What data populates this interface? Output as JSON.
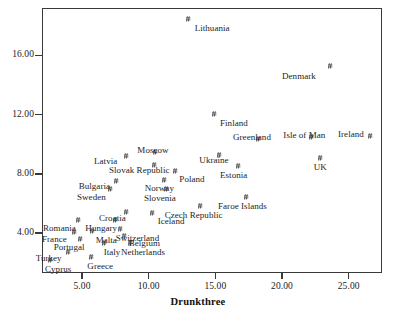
{
  "chart_data": {
    "type": "scatter",
    "title": "",
    "xlabel": "Drunkthree",
    "ylabel": "",
    "xlim": [
      2.0,
      27.5
    ],
    "ylim": [
      1.3,
      19.2
    ],
    "grid": false,
    "legend": "none",
    "marker": "hash-marker",
    "xticks": [
      "5.00",
      "10.00",
      "15.00",
      "20.00",
      "25.00"
    ],
    "xtick_values": [
      5,
      10,
      15,
      20,
      25
    ],
    "yticks": [
      "4.00",
      "8.00",
      "12.00",
      "16.00"
    ],
    "ytick_values": [
      4,
      8,
      12,
      16
    ],
    "points": [
      {
        "label": "Lithuania",
        "x": 13.0,
        "y": 18.45,
        "lx": 6,
        "ly": 4
      },
      {
        "label": "Denmark",
        "x": 23.6,
        "y": 15.25,
        "lx": -48,
        "ly": 5
      },
      {
        "label": "Finland",
        "x": 14.9,
        "y": 12.05,
        "lx": 6,
        "ly": 4
      },
      {
        "label": "Ireland",
        "x": 26.6,
        "y": 10.55,
        "lx": -32,
        "ly": -7
      },
      {
        "label": "Isle of Man",
        "x": 22.2,
        "y": 10.5,
        "lx": -28,
        "ly": -7
      },
      {
        "label": "Greenland",
        "x": 18.2,
        "y": 10.35,
        "lx": -25,
        "ly": -7
      },
      {
        "label": "UK",
        "x": 22.9,
        "y": 9.1,
        "lx": -7,
        "ly": 4
      },
      {
        "label": "Ukraine",
        "x": 15.3,
        "y": 9.25,
        "lx": -20,
        "ly": 0
      },
      {
        "label": "Estonia",
        "x": 16.7,
        "y": 8.5,
        "lx": -18,
        "ly": 4
      },
      {
        "label": "Moscow",
        "x": 10.5,
        "y": 9.5,
        "lx": -18,
        "ly": -7
      },
      {
        "label": "Latvia",
        "x": 8.3,
        "y": 9.2,
        "lx": -32,
        "ly": 0
      },
      {
        "label": "Slovak Republic",
        "x": 10.4,
        "y": 8.6,
        "lx": -45,
        "ly": 0
      },
      {
        "label": "Poland",
        "x": 12.0,
        "y": 8.2,
        "lx": 4,
        "ly": 3
      },
      {
        "label": "Norway",
        "x": 11.2,
        "y": 7.55,
        "lx": -20,
        "ly": 3
      },
      {
        "label": "Bulgaria",
        "x": 7.6,
        "y": 7.5,
        "lx": -38,
        "ly": 0
      },
      {
        "label": "Sweden",
        "x": 7.1,
        "y": 7.0,
        "lx": -33,
        "ly": 3
      },
      {
        "label": "Slovenia",
        "x": 11.3,
        "y": 6.95,
        "lx": -22,
        "ly": 4
      },
      {
        "label": "Faroe Islands",
        "x": 17.3,
        "y": 6.4,
        "lx": -28,
        "ly": 4
      },
      {
        "label": "Czech Republic",
        "x": 13.9,
        "y": 5.85,
        "lx": -36,
        "ly": 4
      },
      {
        "label": "Croatia",
        "x": 8.3,
        "y": 5.4,
        "lx": -27,
        "ly": 1
      },
      {
        "label": "Iceland",
        "x": 10.3,
        "y": 5.35,
        "lx": 5,
        "ly": 3
      },
      {
        "label": "Hungary",
        "x": 7.5,
        "y": 4.85,
        "lx": -30,
        "ly": 3
      },
      {
        "label": "Switzerland",
        "x": 7.9,
        "y": 4.25,
        "lx": -5,
        "ly": 4
      },
      {
        "label": "Malta",
        "x": 5.8,
        "y": 4.15,
        "lx": 3,
        "ly": 4
      },
      {
        "label": "Romania",
        "x": 4.7,
        "y": 4.85,
        "lx": -35,
        "ly": 3
      },
      {
        "label": "Belgium",
        "x": 8.2,
        "y": 3.8,
        "lx": 4,
        "ly": 2
      },
      {
        "label": "France",
        "x": 4.4,
        "y": 4.1,
        "lx": -32,
        "ly": 2
      },
      {
        "label": "Portugal",
        "x": 4.9,
        "y": 3.6,
        "lx": -27,
        "ly": 3
      },
      {
        "label": "Italy",
        "x": 6.7,
        "y": 3.35,
        "lx": -1,
        "ly": 4
      },
      {
        "label": "Netherlands",
        "x": 8.6,
        "y": 3.3,
        "lx": -9,
        "ly": 4
      },
      {
        "label": "Turkey",
        "x": 4.0,
        "y": 2.75,
        "lx": -33,
        "ly": 1
      },
      {
        "label": "Greece",
        "x": 5.7,
        "y": 2.35,
        "lx": -4,
        "ly": 4
      },
      {
        "label": "Cyprus",
        "x": 2.6,
        "y": 2.15,
        "lx": -5,
        "ly": 4
      }
    ]
  }
}
